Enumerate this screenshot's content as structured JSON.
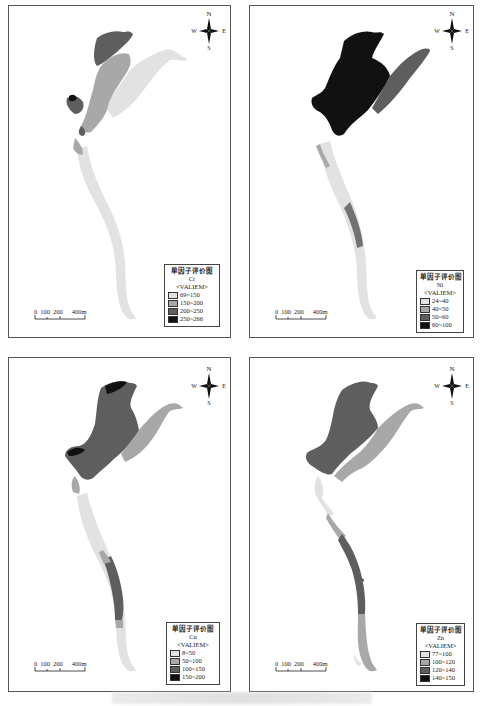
{
  "figure": {
    "caption": ""
  },
  "panels": [
    {
      "id": "cr",
      "legend": {
        "title": "单因子评价图",
        "element": "Cr",
        "field": "<VALIEM>",
        "classes": [
          {
            "label": "69~150",
            "color": "#e2e2e2"
          },
          {
            "label": "150~200",
            "color": "#a8a8a8"
          },
          {
            "label": "200~250",
            "color": "#5e5e5e"
          },
          {
            "label": "250~266",
            "color": "#111111"
          }
        ]
      },
      "scale": {
        "ticks": [
          "0",
          "100",
          "200",
          "400m"
        ]
      },
      "compass": {
        "n": "N",
        "s": "S",
        "e": "E",
        "w": "W"
      }
    },
    {
      "id": "ni",
      "legend": {
        "title": "单因子评价图",
        "element": "Ni",
        "field": "<VALIEM>",
        "classes": [
          {
            "label": "24~40",
            "color": "#e2e2e2"
          },
          {
            "label": "40~50",
            "color": "#a8a8a8"
          },
          {
            "label": "50~60",
            "color": "#5e5e5e"
          },
          {
            "label": "60~100",
            "color": "#111111"
          }
        ]
      },
      "scale": {
        "ticks": [
          "0",
          "100",
          "200",
          "400m"
        ]
      },
      "compass": {
        "n": "N",
        "s": "S",
        "e": "E",
        "w": "W"
      }
    },
    {
      "id": "cu",
      "legend": {
        "title": "单因子评价图",
        "element": "Cu",
        "field": "<VALIEM>",
        "classes": [
          {
            "label": "8~50",
            "color": "#e2e2e2"
          },
          {
            "label": "50~100",
            "color": "#a8a8a8"
          },
          {
            "label": "100~150",
            "color": "#5e5e5e"
          },
          {
            "label": "150~200",
            "color": "#111111"
          }
        ]
      },
      "scale": {
        "ticks": [
          "0",
          "100",
          "200",
          "400m"
        ]
      },
      "compass": {
        "n": "N",
        "s": "S",
        "e": "E",
        "w": "W"
      }
    },
    {
      "id": "zn",
      "legend": {
        "title": "单因子评价图",
        "element": "Zn",
        "field": "<VALIEM>",
        "classes": [
          {
            "label": "77~100",
            "color": "#e2e2e2"
          },
          {
            "label": "100~120",
            "color": "#a8a8a8"
          },
          {
            "label": "120~140",
            "color": "#5e5e5e"
          },
          {
            "label": "140~150",
            "color": "#111111"
          }
        ]
      },
      "scale": {
        "ticks": [
          "0",
          "100",
          "200",
          "400m"
        ]
      },
      "compass": {
        "n": "N",
        "s": "S",
        "e": "E",
        "w": "W"
      }
    }
  ]
}
